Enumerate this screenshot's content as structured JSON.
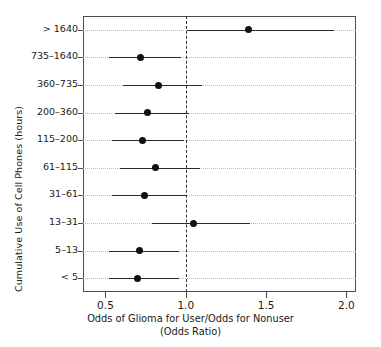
{
  "chart_data": {
    "type": "scatter",
    "subtype": "forest-plot",
    "title": "",
    "xlabel": "Odds of Glioma for User/Odds for Nonuser",
    "xlabel_line2": "(Odds Ratio)",
    "ylabel": "Cumulative Use of Cell Phones (hours)",
    "xlim": [
      0.36,
      2.06
    ],
    "xticks": [
      0.5,
      1.0,
      1.5,
      2.0
    ],
    "xtick_labels": [
      "0.5",
      "1.0",
      "1.5",
      "2.0"
    ],
    "grid": "horizontal-dotted",
    "reference_line": 1.0,
    "legend": "none",
    "categories": [
      "> 1640",
      "735–1640",
      "360–735",
      "200–360",
      "115–200",
      "61–115",
      "31–61",
      "13–31",
      "5–13",
      "< 5"
    ],
    "series": [
      {
        "name": "Odds Ratio",
        "values": [
          1.39,
          0.72,
          0.83,
          0.76,
          0.73,
          0.81,
          0.74,
          1.05,
          0.71,
          0.7
        ],
        "ci_low": [
          1.01,
          0.52,
          0.61,
          0.56,
          0.54,
          0.59,
          0.54,
          0.79,
          0.52,
          0.52
        ],
        "ci_high": [
          1.92,
          0.97,
          1.1,
          1.02,
          0.99,
          1.09,
          1.0,
          1.4,
          0.96,
          0.96
        ]
      }
    ],
    "points": [
      {
        "label": "> 1640",
        "or": 1.39,
        "lower": 1.01,
        "upper": 1.92
      },
      {
        "label": "735–1640",
        "or": 0.72,
        "lower": 0.52,
        "upper": 0.97
      },
      {
        "label": "360–735",
        "or": 0.83,
        "lower": 0.61,
        "upper": 1.1
      },
      {
        "label": "200–360",
        "or": 0.76,
        "lower": 0.56,
        "upper": 1.02
      },
      {
        "label": "115–200",
        "or": 0.73,
        "lower": 0.54,
        "upper": 0.99
      },
      {
        "label": "61–115",
        "or": 0.81,
        "lower": 0.59,
        "upper": 1.09
      },
      {
        "label": "31–61",
        "or": 0.74,
        "lower": 0.54,
        "upper": 1.0
      },
      {
        "label": "13–31",
        "or": 1.05,
        "lower": 0.79,
        "upper": 1.4
      },
      {
        "label": "5–13",
        "or": 0.71,
        "lower": 0.52,
        "upper": 0.96
      },
      {
        "label": "< 5",
        "or": 0.7,
        "lower": 0.52,
        "upper": 0.96
      }
    ],
    "colors": {
      "point": "#111111",
      "ci": "#2b2b2b",
      "grid": "#b9b9b9",
      "frame": "#4d4d4d",
      "reference": "#333333",
      "background": "#ffffff"
    }
  }
}
